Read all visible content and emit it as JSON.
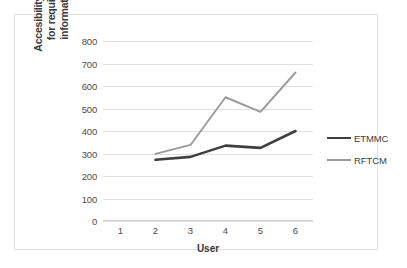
{
  "chart_data": {
    "type": "line",
    "title": "",
    "xlabel": "User",
    "ylabel": "Accesibility time for required information",
    "ylabel_lines": [
      "Accesibility time",
      "for required",
      "information"
    ],
    "x": [
      1,
      2,
      3,
      4,
      5,
      6
    ],
    "xtick_labels": [
      "1",
      "2",
      "3",
      "4",
      "5",
      "6"
    ],
    "xlim": [
      0.5,
      6.5
    ],
    "ylim": [
      0,
      800
    ],
    "ytick_labels": [
      "0",
      "100",
      "200",
      "300",
      "400",
      "500",
      "600",
      "700",
      "800"
    ],
    "yticks": [
      0,
      100,
      200,
      300,
      400,
      500,
      600,
      700,
      800
    ],
    "grid": true,
    "legend_position": "right",
    "series": [
      {
        "name": "ETMMC",
        "color": "#3f3f3f",
        "x": [
          2,
          3,
          4,
          5,
          6
        ],
        "values": [
          272,
          285,
          335,
          325,
          400
        ]
      },
      {
        "name": "RFTCM",
        "color": "#9a9a9a",
        "x": [
          2,
          3,
          4,
          5,
          6
        ],
        "values": [
          298,
          338,
          550,
          485,
          660
        ]
      }
    ]
  },
  "legend": {
    "items": [
      {
        "label": "ETMMC",
        "color": "#3f3f3f"
      },
      {
        "label": "RFTCM",
        "color": "#9a9a9a"
      }
    ]
  }
}
